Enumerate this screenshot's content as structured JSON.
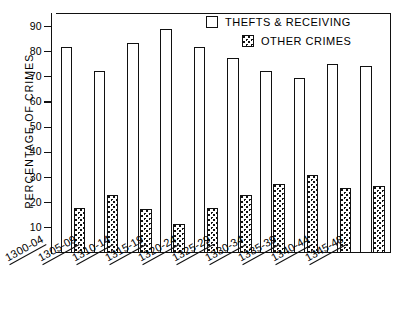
{
  "chart_data": {
    "type": "bar",
    "title": "",
    "xlabel": "",
    "ylabel": "PERCENTAGE OF CRIMES",
    "ylim": [
      0,
      95
    ],
    "yticks": [
      10,
      20,
      30,
      40,
      50,
      60,
      70,
      80,
      90
    ],
    "grid": false,
    "legend_position": "top-right",
    "categories": [
      "1300-04",
      "1305-09",
      "1310-14",
      "1315-19",
      "1320-24",
      "1325-29",
      "1330-34",
      "1335-39",
      "1340-44",
      "1345-48"
    ],
    "series": [
      {
        "name": "THEFTS & RECEIVING",
        "swatch": "open",
        "values": [
          82,
          72.5,
          83.5,
          89,
          82,
          77.5,
          72.5,
          69.5,
          75,
          74.5
        ]
      },
      {
        "name": "OTHER CRIMES",
        "swatch": "stippled",
        "values": [
          18,
          23,
          17.5,
          11.5,
          18,
          23,
          27.5,
          31,
          26,
          26.5
        ]
      }
    ],
    "colors": {
      "ink": "#111111",
      "background": "#ffffff"
    }
  },
  "legend": {
    "items": [
      {
        "label": "THEFTS & RECEIVING"
      },
      {
        "label": "OTHER CRIMES"
      }
    ]
  },
  "axes": {
    "y_title": "PERCENTAGE OF CRIMES",
    "y_tick_labels": [
      "90",
      "80",
      "70",
      "60",
      "50",
      "40",
      "30",
      "20",
      "10"
    ],
    "x_tick_labels": [
      "1300-04",
      "1305-09",
      "1310-14",
      "1315-19",
      "1320-24",
      "1325-29",
      "1330-34",
      "1335-39",
      "1340-44",
      "1345-48"
    ]
  }
}
